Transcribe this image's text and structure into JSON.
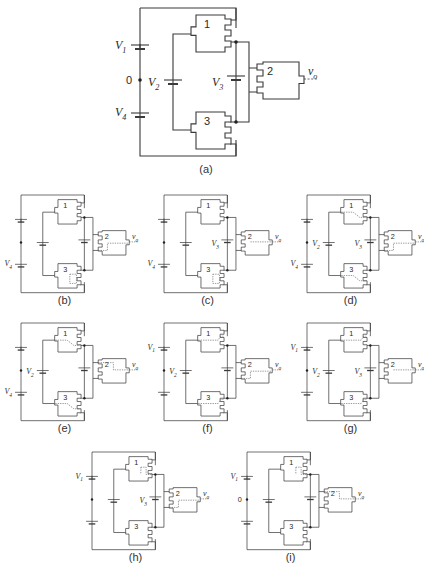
{
  "figure": {
    "background": "#ffffff",
    "line_color": "#3a3a3a",
    "panels": [
      {
        "id": "a",
        "caption": "(a)",
        "x": 140,
        "y": 8,
        "scale": 1.0,
        "labels": {
          "V1": "V",
          "V1_sub": "1",
          "V2": "V",
          "V2_sub": "2",
          "V3": "V",
          "V3_sub": "3",
          "V4": "V",
          "V4_sub": "4",
          "zero": "0",
          "vo": "v",
          "vo_sub": "o"
        },
        "show": {
          "V1": true,
          "V2": true,
          "V3": true,
          "V4": true,
          "zero": true
        },
        "gates": {
          "g1": "1",
          "g2": "2",
          "g3": "3"
        },
        "dashes": []
      },
      {
        "id": "b",
        "caption": "(b)",
        "x": 21,
        "y": 195,
        "scale": 0.66,
        "labels": {
          "V4": "V",
          "V4_sub": "4",
          "vo": "v",
          "vo_sub": "o"
        },
        "show": {
          "V1": false,
          "V2": false,
          "V3": false,
          "V4": true,
          "zero": false
        },
        "gates": {
          "g1": "1",
          "g2": "2",
          "g3": "3"
        },
        "dashes": [
          "g2-bottom-loop",
          "g3-mid-box"
        ]
      },
      {
        "id": "c",
        "caption": "(c)",
        "x": 164,
        "y": 195,
        "scale": 0.66,
        "labels": {
          "V3": "V",
          "V3_sub": "3",
          "V4": "V",
          "V4_sub": "4",
          "vo": "v",
          "vo_sub": "o"
        },
        "show": {
          "V1": false,
          "V2": false,
          "V3": true,
          "V4": true,
          "zero": false
        },
        "gates": {
          "g1": "1",
          "g2": "2",
          "g3": "3"
        },
        "dashes": [
          "g2-out",
          "g3-mid-box"
        ]
      },
      {
        "id": "d",
        "caption": "(d)",
        "x": 307,
        "y": 195,
        "scale": 0.66,
        "labels": {
          "V2": "V",
          "V2_sub": "2",
          "V3": "V",
          "V3_sub": "3",
          "V4": "V",
          "V4_sub": "4",
          "vo": "v",
          "vo_sub": "o"
        },
        "show": {
          "V1": false,
          "V2": true,
          "V3": true,
          "V4": true,
          "zero": false
        },
        "gates": {
          "g1": "1",
          "g2": "2",
          "g3": "3"
        },
        "dashes": [
          "g1-diag",
          "g3-diag",
          "g2-bottom-loop"
        ]
      },
      {
        "id": "e",
        "caption": "(e)",
        "x": 21,
        "y": 323,
        "scale": 0.66,
        "labels": {
          "V2": "V",
          "V2_sub": "2",
          "V4": "V",
          "V4_sub": "4",
          "vo": "v",
          "vo_sub": "o"
        },
        "show": {
          "V1": false,
          "V2": true,
          "V3": false,
          "V4": true,
          "zero": false
        },
        "gates": {
          "g1": "1",
          "g2": "2",
          "g3": "3"
        },
        "dashes": [
          "g1-diag",
          "g3-diag",
          "g2-in"
        ]
      },
      {
        "id": "f",
        "caption": "(f)",
        "x": 164,
        "y": 323,
        "scale": 0.66,
        "labels": {
          "V1": "V",
          "V1_sub": "1",
          "V2": "V",
          "V2_sub": "2",
          "vo": "v",
          "vo_sub": "o"
        },
        "show": {
          "V1": true,
          "V2": true,
          "V3": false,
          "V4": false,
          "zero": false
        },
        "gates": {
          "g1": "1",
          "g2": "2",
          "g3": "3"
        },
        "dashes": [
          "g1-top",
          "g3-top",
          "g2-bottom-loop"
        ]
      },
      {
        "id": "g",
        "caption": "(g)",
        "x": 307,
        "y": 323,
        "scale": 0.66,
        "labels": {
          "V1": "V",
          "V1_sub": "1",
          "V2": "V",
          "V2_sub": "2",
          "V3": "V",
          "V3_sub": "3",
          "vo": "v",
          "vo_sub": "o"
        },
        "show": {
          "V1": true,
          "V2": true,
          "V3": true,
          "V4": false,
          "zero": false
        },
        "gates": {
          "g1": "1",
          "g2": "2",
          "g3": "3"
        },
        "dashes": [
          "g1-top",
          "g3-top",
          "g2-out"
        ]
      },
      {
        "id": "h",
        "caption": "(h)",
        "x": 92,
        "y": 452,
        "scale": 0.66,
        "labels": {
          "V1": "V",
          "V1_sub": "1",
          "V3": "V",
          "V3_sub": "3",
          "vo": "v",
          "vo_sub": "o"
        },
        "show": {
          "V1": true,
          "V2": false,
          "V3": true,
          "V4": false,
          "zero": false
        },
        "gates": {
          "g1": "1",
          "g2": "2",
          "g3": "3"
        },
        "dashes": [
          "g1-mid-box",
          "g2-bottom-loop"
        ]
      },
      {
        "id": "i",
        "caption": "(i)",
        "x": 247,
        "y": 452,
        "scale": 0.66,
        "labels": {
          "V1": "V",
          "V1_sub": "1",
          "zero": "0",
          "vo": "v",
          "vo_sub": "o"
        },
        "show": {
          "V1": true,
          "V2": false,
          "V3": false,
          "V4": false,
          "zero": true
        },
        "gates": {
          "g1": "1",
          "g2": "2",
          "g3": "3"
        },
        "dashes": [
          "g1-mid-box",
          "g2-in"
        ]
      }
    ]
  }
}
